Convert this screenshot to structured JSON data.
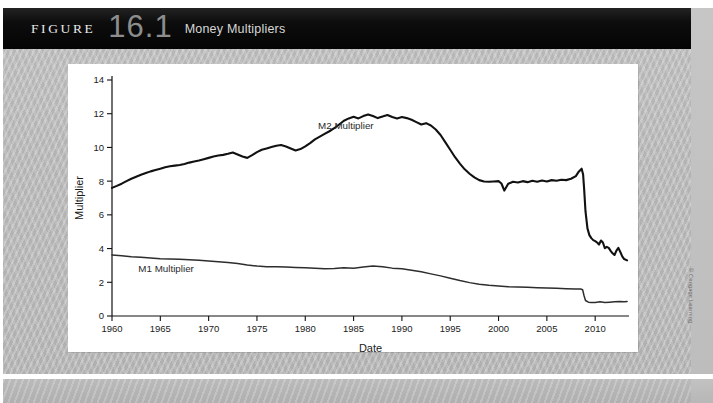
{
  "banner": {
    "figure_word": "FIGURE",
    "figure_number": "16.1",
    "figure_title": "Money Multipliers"
  },
  "credit": "© Cengage Learning",
  "chart_data": {
    "type": "line",
    "title": "Money Multipliers",
    "xlabel": "Date",
    "ylabel": "Multiplier",
    "xlim": [
      1960,
      2013.5
    ],
    "ylim": [
      0,
      14
    ],
    "yticks": [
      0,
      2,
      4,
      6,
      8,
      10,
      12,
      14
    ],
    "xticks": [
      1960,
      1965,
      1970,
      1975,
      1980,
      1985,
      1990,
      1995,
      2000,
      2005,
      2010
    ],
    "grid": false,
    "legend_position": "inline-annotation",
    "annotations": [
      {
        "text": "M2 Multiplier",
        "x": 1984.2,
        "y": 11.1
      },
      {
        "text": "M1 Multiplier",
        "x": 1965.6,
        "y": 2.62
      }
    ],
    "series": [
      {
        "name": "M2 Multiplier",
        "color": "#111111",
        "width": 2.1,
        "x": [
          1960,
          1960.5,
          1961,
          1961.5,
          1962,
          1962.5,
          1963,
          1963.5,
          1964,
          1964.5,
          1965,
          1965.5,
          1966,
          1966.5,
          1967,
          1967.5,
          1968,
          1968.5,
          1969,
          1969.5,
          1970,
          1970.5,
          1971,
          1971.5,
          1972,
          1972.5,
          1973,
          1973.5,
          1974,
          1974.5,
          1975,
          1975.5,
          1976,
          1976.5,
          1977,
          1977.5,
          1978,
          1978.5,
          1979,
          1979.5,
          1980,
          1980.5,
          1981,
          1981.5,
          1982,
          1982.5,
          1983,
          1983.5,
          1984,
          1984.5,
          1985,
          1985.5,
          1986,
          1986.5,
          1987,
          1987.5,
          1988,
          1988.5,
          1989,
          1989.5,
          1990,
          1990.5,
          1991,
          1991.5,
          1992,
          1992.5,
          1993,
          1993.5,
          1994,
          1994.5,
          1995,
          1995.5,
          1996,
          1996.5,
          1997,
          1997.5,
          1998,
          1998.5,
          1999,
          1999.5,
          2000,
          2000.3,
          2000.6,
          2001,
          2001.5,
          2002,
          2002.5,
          2003,
          2003.5,
          2004,
          2004.5,
          2005,
          2005.5,
          2006,
          2006.5,
          2007,
          2007.5,
          2008,
          2008.3,
          2008.6,
          2008.75,
          2008.85,
          2009,
          2009.2,
          2009.4,
          2009.6,
          2009.8,
          2010,
          2010.2,
          2010.4,
          2010.6,
          2010.8,
          2011,
          2011.2,
          2011.4,
          2011.6,
          2011.8,
          2012,
          2012.2,
          2012.4,
          2012.6,
          2012.8,
          2013,
          2013.3
        ],
        "y": [
          7.6,
          7.72,
          7.85,
          8.0,
          8.14,
          8.26,
          8.38,
          8.48,
          8.58,
          8.66,
          8.74,
          8.82,
          8.88,
          8.92,
          8.96,
          9.02,
          9.1,
          9.16,
          9.22,
          9.3,
          9.38,
          9.46,
          9.52,
          9.56,
          9.62,
          9.7,
          9.58,
          9.46,
          9.38,
          9.54,
          9.72,
          9.86,
          9.94,
          10.02,
          10.1,
          10.14,
          10.06,
          9.94,
          9.82,
          9.9,
          10.06,
          10.26,
          10.48,
          10.64,
          10.8,
          10.96,
          11.14,
          11.36,
          11.58,
          11.72,
          11.82,
          11.72,
          11.86,
          11.96,
          11.86,
          11.74,
          11.84,
          11.92,
          11.8,
          11.72,
          11.8,
          11.74,
          11.64,
          11.5,
          11.36,
          11.44,
          11.3,
          11.06,
          10.74,
          10.3,
          9.86,
          9.42,
          9.04,
          8.7,
          8.44,
          8.22,
          8.06,
          7.98,
          7.96,
          7.98,
          8.0,
          7.86,
          7.44,
          7.84,
          7.96,
          7.92,
          8.0,
          7.94,
          8.02,
          7.96,
          8.04,
          7.98,
          8.06,
          8.02,
          8.08,
          8.06,
          8.14,
          8.3,
          8.56,
          8.74,
          8.4,
          7.6,
          6.2,
          5.2,
          4.8,
          4.62,
          4.5,
          4.44,
          4.36,
          4.24,
          4.48,
          4.36,
          4.02,
          4.1,
          4.04,
          3.86,
          3.72,
          3.62,
          3.88,
          4.04,
          3.8,
          3.54,
          3.38,
          3.3
        ]
      },
      {
        "name": "M1 Multiplier",
        "color": "#2d2d2d",
        "width": 1.5,
        "x": [
          1960,
          1961,
          1962,
          1963,
          1964,
          1965,
          1966,
          1967,
          1968,
          1969,
          1970,
          1971,
          1972,
          1973,
          1974,
          1975,
          1976,
          1977,
          1978,
          1979,
          1980,
          1981,
          1982,
          1983,
          1984,
          1985,
          1986,
          1987,
          1988,
          1989,
          1990,
          1991,
          1992,
          1993,
          1994,
          1995,
          1996,
          1997,
          1998,
          1999,
          2000,
          2001,
          2002,
          2003,
          2004,
          2005,
          2006,
          2007,
          2008,
          2008.5,
          2008.7,
          2008.85,
          2009,
          2009.3,
          2009.6,
          2010,
          2010.5,
          2011,
          2011.5,
          2012,
          2012.5,
          2013,
          2013.3
        ],
        "y": [
          3.62,
          3.58,
          3.52,
          3.48,
          3.44,
          3.4,
          3.38,
          3.36,
          3.34,
          3.3,
          3.26,
          3.22,
          3.18,
          3.12,
          3.02,
          2.96,
          2.92,
          2.92,
          2.9,
          2.88,
          2.86,
          2.84,
          2.8,
          2.82,
          2.86,
          2.84,
          2.9,
          2.96,
          2.92,
          2.84,
          2.8,
          2.72,
          2.62,
          2.5,
          2.38,
          2.24,
          2.1,
          1.98,
          1.88,
          1.82,
          1.78,
          1.74,
          1.72,
          1.7,
          1.68,
          1.66,
          1.64,
          1.62,
          1.6,
          1.6,
          1.56,
          1.2,
          0.92,
          0.82,
          0.8,
          0.8,
          0.84,
          0.8,
          0.82,
          0.84,
          0.86,
          0.84,
          0.86
        ]
      }
    ]
  }
}
